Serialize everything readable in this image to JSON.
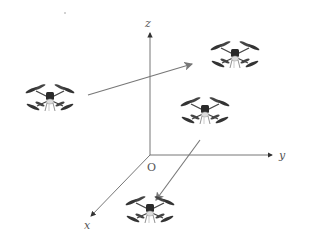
{
  "diagram": {
    "type": "3d-coordinate-frame-with-drones",
    "axes": {
      "origin_label": "O",
      "x_label": "x",
      "y_label": "y",
      "z_label": "z",
      "origin": [
        150,
        155
      ],
      "x_end": [
        91,
        216
      ],
      "y_end": [
        272,
        155
      ],
      "z_end": [
        150,
        33
      ]
    },
    "drones": [
      {
        "id": "drone-left",
        "center": [
          50,
          98
        ]
      },
      {
        "id": "drone-top-right",
        "center": [
          235,
          55
        ]
      },
      {
        "id": "drone-middle-right",
        "center": [
          205,
          111
        ]
      },
      {
        "id": "drone-bottom",
        "center": [
          150,
          210
        ]
      }
    ],
    "arrows": [
      {
        "id": "arrow-left-to-top-right",
        "from": [
          88,
          95
        ],
        "to": [
          192,
          64
        ]
      },
      {
        "id": "arrow-middle-to-bottom",
        "from": [
          200,
          140
        ],
        "to": [
          156,
          200
        ]
      }
    ],
    "colors": {
      "axis": "#555555",
      "arrow": "#777777",
      "drone_arm": "#333333",
      "drone_body": "#2a2a2a",
      "drone_light": "#dddddd"
    }
  }
}
